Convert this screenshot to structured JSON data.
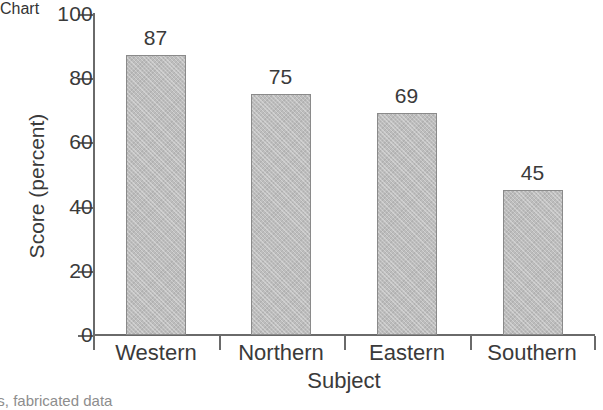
{
  "chart_data": {
    "type": "bar",
    "title": "",
    "xlabel": "Subject",
    "ylabel": "Score (percent)",
    "categories": [
      "Western",
      "Northern",
      "Eastern",
      "Southern"
    ],
    "values": [
      87,
      75,
      69,
      45
    ],
    "value_labels": [
      "87",
      "75",
      "69",
      "45"
    ],
    "ylim": [
      0,
      100
    ],
    "yticks": [
      0,
      20,
      40,
      60,
      80,
      100
    ],
    "ytick_labels": [
      "0",
      "20",
      "40",
      "60",
      "80",
      "100"
    ],
    "grid": false,
    "legend": false,
    "legend_position": "none",
    "bar_color": "#bdbdbd",
    "bar_border_color": "#8a8a8a",
    "axis_color": "#6a6a6a",
    "text_color": "#3a3a3a",
    "background": "#ffffff"
  },
  "caption": {
    "text": "ers, fabricated data"
  }
}
